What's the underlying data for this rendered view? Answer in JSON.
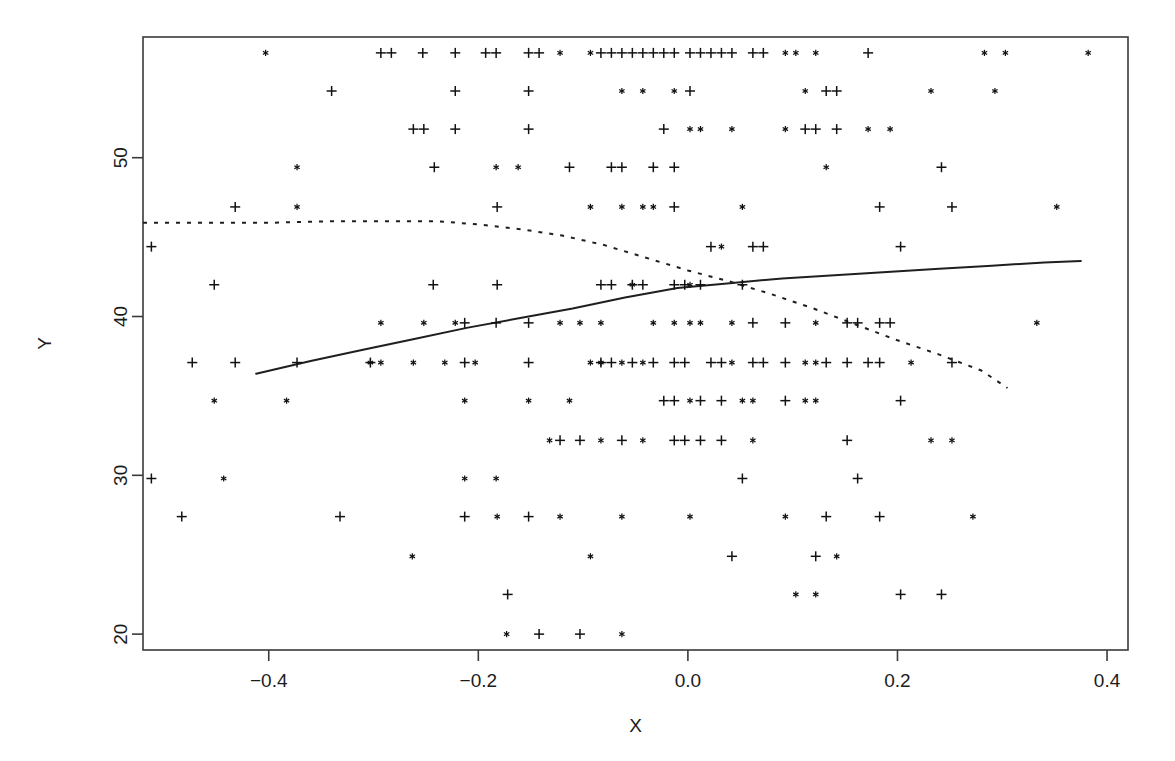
{
  "chart_data": {
    "type": "scatter",
    "title": "",
    "xlabel": "X",
    "ylabel": "Y",
    "xlim": [
      -0.52,
      0.42
    ],
    "ylim": [
      19.0,
      57.6
    ],
    "grid": false,
    "legend": "none",
    "xticks": [
      -0.4,
      -0.2,
      0.0,
      0.2,
      0.4
    ],
    "xticklabels": [
      "-0.4",
      "-0.2",
      "0.0",
      "0.2",
      "0.4"
    ],
    "yticks": [
      20,
      30,
      40,
      50
    ],
    "yticklabels": [
      "20",
      "30",
      "40",
      "50"
    ],
    "marker_types": [
      {
        "name": "plus",
        "symbol": "+",
        "color": "#121212"
      },
      {
        "name": "star",
        "symbol": "*",
        "color": "#121212"
      }
    ],
    "note": "Observations fall on discrete Y levels (banded / ceiling-floor response scale).",
    "y_bands": [
      56.6,
      54.2,
      51.8,
      49.4,
      46.9,
      44.4,
      42.0,
      39.6,
      37.1,
      34.7,
      32.2,
      29.8,
      27.4,
      24.9,
      22.4,
      20.0
    ],
    "series": [
      {
        "name": "plus-markers",
        "marker": "plus",
        "points": [
          [
            -0.293,
            56.6
          ],
          [
            -0.283,
            56.6
          ],
          [
            -0.253,
            56.6
          ],
          [
            -0.222,
            56.6
          ],
          [
            -0.193,
            56.6
          ],
          [
            -0.183,
            56.6
          ],
          [
            -0.152,
            56.6
          ],
          [
            -0.142,
            56.6
          ],
          [
            -0.083,
            56.6
          ],
          [
            -0.073,
            56.6
          ],
          [
            -0.063,
            56.6
          ],
          [
            -0.053,
            56.6
          ],
          [
            -0.043,
            56.6
          ],
          [
            -0.033,
            56.6
          ],
          [
            -0.023,
            56.6
          ],
          [
            -0.013,
            56.6
          ],
          [
            0.002,
            56.6
          ],
          [
            0.012,
            56.6
          ],
          [
            0.022,
            56.6
          ],
          [
            0.032,
            56.6
          ],
          [
            0.042,
            56.6
          ],
          [
            0.062,
            56.6
          ],
          [
            0.072,
            56.6
          ],
          [
            0.172,
            56.6
          ],
          [
            -0.34,
            54.2
          ],
          [
            -0.222,
            54.2
          ],
          [
            -0.152,
            54.2
          ],
          [
            0.002,
            54.2
          ],
          [
            0.132,
            54.2
          ],
          [
            0.142,
            54.2
          ],
          [
            -0.262,
            51.8
          ],
          [
            -0.252,
            51.8
          ],
          [
            -0.222,
            51.8
          ],
          [
            -0.152,
            51.8
          ],
          [
            -0.023,
            51.8
          ],
          [
            0.112,
            51.8
          ],
          [
            0.122,
            51.8
          ],
          [
            0.142,
            51.8
          ],
          [
            -0.242,
            49.4
          ],
          [
            -0.113,
            49.4
          ],
          [
            -0.073,
            49.4
          ],
          [
            -0.063,
            49.4
          ],
          [
            -0.033,
            49.4
          ],
          [
            -0.013,
            49.4
          ],
          [
            0.242,
            49.4
          ],
          [
            -0.432,
            46.9
          ],
          [
            -0.182,
            46.9
          ],
          [
            -0.013,
            46.9
          ],
          [
            0.183,
            46.9
          ],
          [
            0.252,
            46.9
          ],
          [
            -0.512,
            44.4
          ],
          [
            0.022,
            44.4
          ],
          [
            0.062,
            44.4
          ],
          [
            0.072,
            44.4
          ],
          [
            0.203,
            44.4
          ],
          [
            -0.452,
            42.0
          ],
          [
            -0.243,
            42.0
          ],
          [
            -0.182,
            42.0
          ],
          [
            -0.083,
            42.0
          ],
          [
            -0.073,
            42.0
          ],
          [
            -0.053,
            42.0
          ],
          [
            -0.043,
            42.0
          ],
          [
            -0.013,
            42.0
          ],
          [
            -0.003,
            42.0
          ],
          [
            0.012,
            42.0
          ],
          [
            0.052,
            42.0
          ],
          [
            -0.213,
            39.6
          ],
          [
            -0.183,
            39.6
          ],
          [
            -0.152,
            39.6
          ],
          [
            0.062,
            39.6
          ],
          [
            0.093,
            39.6
          ],
          [
            0.152,
            39.6
          ],
          [
            0.162,
            39.6
          ],
          [
            0.183,
            39.6
          ],
          [
            0.193,
            39.6
          ],
          [
            -0.473,
            37.1
          ],
          [
            -0.432,
            37.1
          ],
          [
            -0.373,
            37.1
          ],
          [
            -0.303,
            37.1
          ],
          [
            -0.213,
            37.1
          ],
          [
            -0.152,
            37.1
          ],
          [
            -0.083,
            37.1
          ],
          [
            -0.073,
            37.1
          ],
          [
            -0.053,
            37.1
          ],
          [
            -0.033,
            37.1
          ],
          [
            -0.013,
            37.1
          ],
          [
            -0.003,
            37.1
          ],
          [
            0.022,
            37.1
          ],
          [
            0.032,
            37.1
          ],
          [
            0.062,
            37.1
          ],
          [
            0.072,
            37.1
          ],
          [
            0.093,
            37.1
          ],
          [
            0.132,
            37.1
          ],
          [
            0.152,
            37.1
          ],
          [
            0.172,
            37.1
          ],
          [
            0.183,
            37.1
          ],
          [
            0.252,
            37.1
          ],
          [
            -0.023,
            34.7
          ],
          [
            -0.013,
            34.7
          ],
          [
            0.012,
            34.7
          ],
          [
            0.032,
            34.7
          ],
          [
            0.093,
            34.7
          ],
          [
            0.203,
            34.7
          ],
          [
            -0.122,
            32.2
          ],
          [
            -0.103,
            32.2
          ],
          [
            -0.063,
            32.2
          ],
          [
            -0.013,
            32.2
          ],
          [
            -0.003,
            32.2
          ],
          [
            0.012,
            32.2
          ],
          [
            0.032,
            32.2
          ],
          [
            0.152,
            32.2
          ],
          [
            -0.512,
            29.8
          ],
          [
            0.052,
            29.8
          ],
          [
            0.162,
            29.8
          ],
          [
            -0.483,
            27.4
          ],
          [
            -0.332,
            27.4
          ],
          [
            -0.213,
            27.4
          ],
          [
            -0.152,
            27.4
          ],
          [
            0.132,
            27.4
          ],
          [
            0.183,
            27.4
          ],
          [
            0.042,
            24.9
          ],
          [
            0.122,
            24.9
          ],
          [
            -0.172,
            22.5
          ],
          [
            0.203,
            22.5
          ],
          [
            0.242,
            22.5
          ],
          [
            -0.142,
            20.0
          ],
          [
            -0.103,
            20.0
          ],
          [
            0.112,
            17.6
          ],
          [
            0.122,
            17.6
          ]
        ]
      },
      {
        "name": "star-markers",
        "marker": "star",
        "points": [
          [
            -0.403,
            56.6
          ],
          [
            -0.122,
            56.6
          ],
          [
            -0.093,
            56.6
          ],
          [
            0.093,
            56.6
          ],
          [
            0.103,
            56.6
          ],
          [
            0.122,
            56.6
          ],
          [
            0.283,
            56.6
          ],
          [
            0.303,
            56.6
          ],
          [
            0.382,
            56.6
          ],
          [
            -0.063,
            54.2
          ],
          [
            -0.043,
            54.2
          ],
          [
            -0.013,
            54.2
          ],
          [
            0.112,
            54.2
          ],
          [
            0.232,
            54.2
          ],
          [
            0.293,
            54.2
          ],
          [
            0.002,
            51.8
          ],
          [
            0.012,
            51.8
          ],
          [
            0.042,
            51.8
          ],
          [
            0.093,
            51.8
          ],
          [
            0.172,
            51.8
          ],
          [
            0.193,
            51.8
          ],
          [
            -0.373,
            49.4
          ],
          [
            -0.183,
            49.4
          ],
          [
            -0.162,
            49.4
          ],
          [
            0.132,
            49.4
          ],
          [
            -0.373,
            46.9
          ],
          [
            -0.093,
            46.9
          ],
          [
            -0.063,
            46.9
          ],
          [
            -0.043,
            46.9
          ],
          [
            -0.033,
            46.9
          ],
          [
            0.052,
            46.9
          ],
          [
            0.352,
            46.9
          ],
          [
            0.032,
            44.4
          ],
          [
            -0.053,
            42.0
          ],
          [
            0.002,
            42.0
          ],
          [
            -0.293,
            39.6
          ],
          [
            -0.252,
            39.6
          ],
          [
            -0.222,
            39.6
          ],
          [
            -0.122,
            39.6
          ],
          [
            -0.103,
            39.6
          ],
          [
            -0.083,
            39.6
          ],
          [
            -0.033,
            39.6
          ],
          [
            -0.013,
            39.6
          ],
          [
            0.002,
            39.6
          ],
          [
            0.012,
            39.6
          ],
          [
            0.042,
            39.6
          ],
          [
            0.122,
            39.6
          ],
          [
            0.333,
            39.6
          ],
          [
            -0.303,
            37.1
          ],
          [
            -0.293,
            37.1
          ],
          [
            -0.262,
            37.1
          ],
          [
            -0.232,
            37.1
          ],
          [
            -0.203,
            37.1
          ],
          [
            -0.093,
            37.1
          ],
          [
            -0.083,
            37.1
          ],
          [
            -0.063,
            37.1
          ],
          [
            -0.043,
            37.1
          ],
          [
            0.042,
            37.1
          ],
          [
            0.112,
            37.1
          ],
          [
            0.122,
            37.1
          ],
          [
            0.213,
            37.1
          ],
          [
            -0.452,
            34.7
          ],
          [
            -0.383,
            34.7
          ],
          [
            -0.213,
            34.7
          ],
          [
            -0.152,
            34.7
          ],
          [
            -0.113,
            34.7
          ],
          [
            0.002,
            34.7
          ],
          [
            0.052,
            34.7
          ],
          [
            0.062,
            34.7
          ],
          [
            0.112,
            34.7
          ],
          [
            0.122,
            34.7
          ],
          [
            -0.132,
            32.2
          ],
          [
            -0.083,
            32.2
          ],
          [
            -0.043,
            32.2
          ],
          [
            0.062,
            32.2
          ],
          [
            0.232,
            32.2
          ],
          [
            0.252,
            32.2
          ],
          [
            -0.443,
            29.8
          ],
          [
            -0.213,
            29.8
          ],
          [
            -0.183,
            29.8
          ],
          [
            -0.182,
            27.4
          ],
          [
            -0.122,
            27.4
          ],
          [
            -0.063,
            27.4
          ],
          [
            0.002,
            27.4
          ],
          [
            0.093,
            27.4
          ],
          [
            0.272,
            27.4
          ],
          [
            -0.263,
            24.9
          ],
          [
            -0.093,
            24.9
          ],
          [
            0.142,
            24.9
          ],
          [
            0.103,
            22.5
          ],
          [
            0.122,
            22.5
          ],
          [
            -0.173,
            20.0
          ],
          [
            -0.063,
            20.0
          ],
          [
            -0.333,
            17.6
          ],
          [
            -0.283,
            17.6
          ],
          [
            -0.152,
            17.6
          ],
          [
            -0.093,
            17.6
          ],
          [
            -0.083,
            17.6
          ],
          [
            -0.013,
            17.6
          ],
          [
            0.052,
            17.6
          ],
          [
            0.103,
            17.6
          ],
          [
            0.333,
            17.6
          ]
        ]
      }
    ],
    "curves": [
      {
        "name": "solid-fit",
        "style": "solid",
        "points": [
          [
            -0.412,
            36.4
          ],
          [
            -0.36,
            37.2
          ],
          [
            -0.31,
            37.9
          ],
          [
            -0.26,
            38.6
          ],
          [
            -0.21,
            39.3
          ],
          [
            -0.16,
            39.9
          ],
          [
            -0.11,
            40.5
          ],
          [
            -0.06,
            41.2
          ],
          [
            -0.01,
            41.8
          ],
          [
            0.04,
            42.1
          ],
          [
            0.09,
            42.4
          ],
          [
            0.14,
            42.6
          ],
          [
            0.19,
            42.8
          ],
          [
            0.24,
            43.0
          ],
          [
            0.29,
            43.2
          ],
          [
            0.34,
            43.4
          ],
          [
            0.375,
            43.5
          ]
        ]
      },
      {
        "name": "dashed-fit",
        "style": "dashed",
        "points": [
          [
            -0.52,
            45.9
          ],
          [
            -0.46,
            45.9
          ],
          [
            -0.4,
            45.9
          ],
          [
            -0.34,
            46.0
          ],
          [
            -0.28,
            46.0
          ],
          [
            -0.24,
            46.0
          ],
          [
            -0.2,
            45.8
          ],
          [
            -0.16,
            45.5
          ],
          [
            -0.12,
            45.1
          ],
          [
            -0.08,
            44.5
          ],
          [
            -0.04,
            43.7
          ],
          [
            0.0,
            42.9
          ],
          [
            0.04,
            42.2
          ],
          [
            0.08,
            41.4
          ],
          [
            0.12,
            40.5
          ],
          [
            0.16,
            39.5
          ],
          [
            0.2,
            38.5
          ],
          [
            0.24,
            37.6
          ],
          [
            0.28,
            36.6
          ],
          [
            0.305,
            35.5
          ]
        ]
      }
    ]
  },
  "axes": {
    "x_title": "X",
    "y_title": "Y"
  }
}
